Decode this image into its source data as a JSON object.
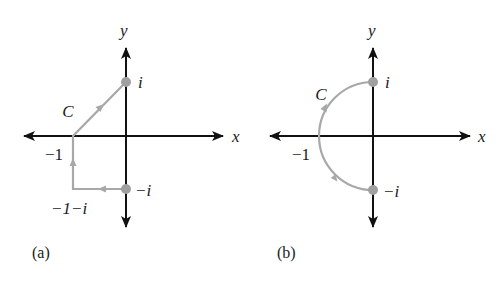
{
  "figure": {
    "panels": [
      {
        "id": "a",
        "caption": "(a)",
        "axis_labels": {
          "x": "x",
          "y": "y"
        },
        "contour_label": "C",
        "contour_shape": "polyline",
        "contour_vertices": [
          {
            "re": 0,
            "im": -1
          },
          {
            "re": -1,
            "im": -1
          },
          {
            "re": -1,
            "im": 0
          },
          {
            "re": 0,
            "im": 1
          }
        ],
        "marked_points": [
          {
            "re": 0,
            "im": 1,
            "label": "i"
          },
          {
            "re": 0,
            "im": -1,
            "label": "−i"
          }
        ],
        "point_labels": {
          "i": "i",
          "minus_i": "−i",
          "minus_one": "−1",
          "minus_one_minus_i": "−1−i"
        },
        "direction": "from −i to −1−i to −1 to i"
      },
      {
        "id": "b",
        "caption": "(b)",
        "axis_labels": {
          "x": "x",
          "y": "y"
        },
        "contour_label": "C",
        "contour_shape": "left semicircle |z| = 1",
        "contour_arc": {
          "center": {
            "re": 0,
            "im": 0
          },
          "radius": 1,
          "from_deg": 270,
          "to_deg": 90,
          "through": "left"
        },
        "marked_points": [
          {
            "re": 0,
            "im": 1,
            "label": "i"
          },
          {
            "re": 0,
            "im": -1,
            "label": "−i"
          }
        ],
        "point_labels": {
          "i": "i",
          "minus_i": "−i",
          "minus_one": "−1"
        },
        "direction": "counterclockwise from −i through −1 to i"
      }
    ],
    "colors": {
      "axis": "#111111",
      "contour": "#a8a8a8",
      "point": "#a0a0a0",
      "text": "#1a1a1a"
    }
  }
}
